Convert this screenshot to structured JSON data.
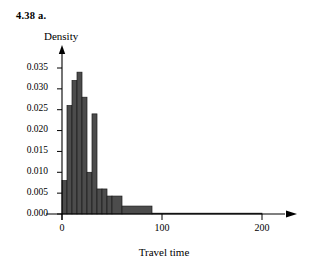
{
  "figure": {
    "problem_label": "4.38  a.",
    "y_axis_title": "Density",
    "x_axis_title": "Travel time"
  },
  "axes": {
    "y_ticks": [
      "0.000",
      "0.005",
      "0.010",
      "0.015",
      "0.020",
      "0.025",
      "0.030",
      "0.035"
    ],
    "x_ticks": [
      "0",
      "100",
      "200"
    ]
  },
  "colors": {
    "bar_fill": "#4c4c4c",
    "bar_stroke": "#1c1c1c",
    "axis": "#000000",
    "background": "#ffffff"
  },
  "chart_data": {
    "type": "bar",
    "title": "4.38  a.",
    "xlabel": "Travel time",
    "ylabel": "Density",
    "xlim": [
      0,
      200
    ],
    "ylim": [
      0.0,
      0.0375
    ],
    "grid": false,
    "legend": null,
    "x_tick_values": [
      0,
      100,
      200
    ],
    "y_tick_values": [
      0.0,
      0.005,
      0.01,
      0.015,
      0.02,
      0.025,
      0.03,
      0.035
    ],
    "bin_edges": [
      0,
      5,
      10,
      15,
      20,
      25,
      30,
      35,
      40,
      45,
      50,
      60,
      90,
      200
    ],
    "densities": [
      0.008,
      0.026,
      0.032,
      0.034,
      0.028,
      0.01,
      0.024,
      0.006,
      0.006,
      0.0043,
      0.0043,
      0.0019,
      0.0002
    ],
    "bars": [
      {
        "x0": 0,
        "x1": 5,
        "density": 0.008
      },
      {
        "x0": 5,
        "x1": 10,
        "density": 0.026
      },
      {
        "x0": 10,
        "x1": 15,
        "density": 0.032
      },
      {
        "x0": 15,
        "x1": 20,
        "density": 0.034
      },
      {
        "x0": 20,
        "x1": 25,
        "density": 0.028
      },
      {
        "x0": 25,
        "x1": 30,
        "density": 0.01
      },
      {
        "x0": 30,
        "x1": 35,
        "density": 0.024
      },
      {
        "x0": 35,
        "x1": 40,
        "density": 0.006
      },
      {
        "x0": 40,
        "x1": 45,
        "density": 0.006
      },
      {
        "x0": 45,
        "x1": 50,
        "density": 0.0043
      },
      {
        "x0": 50,
        "x1": 60,
        "density": 0.0043
      },
      {
        "x0": 60,
        "x1": 90,
        "density": 0.0019
      },
      {
        "x0": 90,
        "x1": 200,
        "density": 0.0002
      }
    ]
  }
}
